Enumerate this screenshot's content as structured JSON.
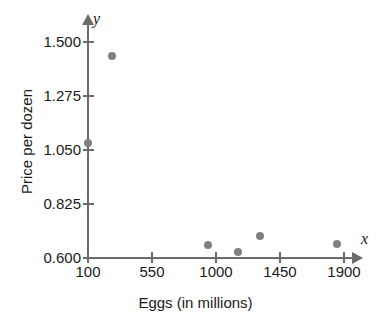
{
  "chart_data": {
    "type": "scatter",
    "title": "",
    "xlabel": "Eggs (in millions)",
    "ylabel": "Price per dozen",
    "x_axis_letter": "x",
    "y_axis_letter": "y",
    "xticks": [
      100,
      550,
      1000,
      1450,
      1900
    ],
    "xtick_labels": [
      "100",
      "550",
      "1000",
      "1450",
      "1900"
    ],
    "yticks": [
      0.6,
      0.825,
      1.05,
      1.275,
      1.5
    ],
    "ytick_labels": [
      "0.600",
      "0.825",
      "1.050",
      "1.275",
      "1.500"
    ],
    "xlim": [
      100,
      1970
    ],
    "ylim": [
      0.6,
      1.545
    ],
    "grid": false,
    "legend": null,
    "marker_color": "#808080",
    "axis_color": "#6b6b6b",
    "text_color": "#1a1a1a",
    "points": [
      {
        "x": 100,
        "y": 1.08
      },
      {
        "x": 270,
        "y": 1.44
      },
      {
        "x": 945,
        "y": 0.655
      },
      {
        "x": 1155,
        "y": 0.625
      },
      {
        "x": 1310,
        "y": 0.69
      },
      {
        "x": 1850,
        "y": 0.66
      }
    ]
  }
}
